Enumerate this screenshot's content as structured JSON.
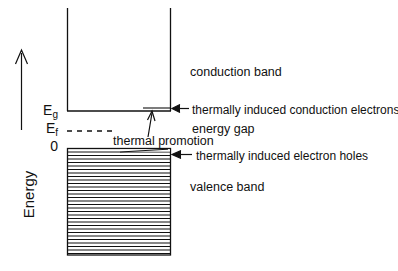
{
  "figure": {
    "background_color": "#ffffff",
    "line_color": "#000000"
  },
  "axis": {
    "label": "Energy",
    "arrow_direction": "up"
  },
  "levels": [
    {
      "name": "band-gap-energy",
      "symbol": "E",
      "subscript": "g",
      "y": 111
    },
    {
      "name": "fermi-energy",
      "symbol": "E",
      "subscript": "f",
      "y": 131
    },
    {
      "name": "zero-energy",
      "symbol": "0",
      "subscript": "",
      "y": 148
    }
  ],
  "labels": {
    "eg_main": "E",
    "eg_sub": "g",
    "ef_main": "E",
    "ef_sub": "f",
    "zero": "0",
    "conduction_band": "conduction band",
    "valence_band": "valence band",
    "energy_gap": "energy gap",
    "thermal_promotion": "thermal promotion",
    "conduction_electrons": "thermally induced conduction electrons",
    "electron_holes": "thermally induced electron holes"
  },
  "geometry": {
    "band_left_x": 67,
    "band_right_x": 170,
    "conduction_top_y": 8,
    "conduction_bottom_y": 111,
    "valence_top_y": 148,
    "valence_bottom_y": 255,
    "fermi_dash_start_x": 67,
    "fermi_dash_end_x": 112,
    "fermi_y": 131,
    "promotion_arrow_x": 152,
    "promotion_arrow_from_y": 136,
    "promotion_arrow_to_y": 113,
    "valence_hatch_count": 30
  }
}
